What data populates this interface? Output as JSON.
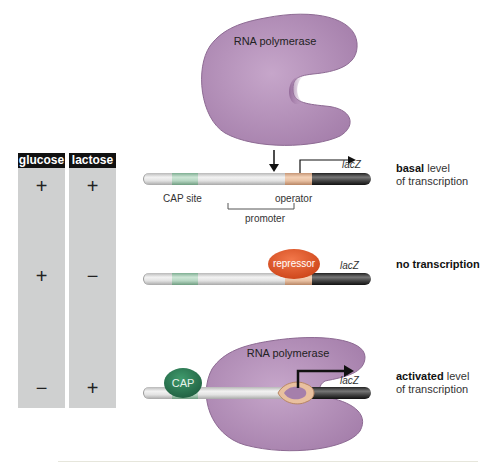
{
  "table": {
    "headers": [
      "glucose",
      "lactose"
    ],
    "rows": [
      {
        "glucose": "+",
        "lactose": "+"
      },
      {
        "glucose": "+",
        "lactose": "−"
      },
      {
        "glucose": "−",
        "lactose": "+"
      }
    ]
  },
  "panels": {
    "basal": {
      "polymerase_label": "RNA polymerase",
      "cap_site_label": "CAP site",
      "operator_label": "operator",
      "promoter_label": "promoter",
      "gene_label": "lacZ",
      "desc_bold": "basal",
      "desc_rest": " level",
      "desc_line2": "of transcription"
    },
    "none": {
      "repressor_label": "repressor",
      "gene_label": "lacZ",
      "desc_bold": "no transcription"
    },
    "activated": {
      "polymerase_label": "RNA polymerase",
      "cap_label": "CAP",
      "gene_label": "lacZ",
      "desc_bold": "activated",
      "desc_rest": " level",
      "desc_line2": "of transcription"
    }
  },
  "colors": {
    "polymerase": "#b38fb8",
    "cap_site": "#a8cdb4",
    "operator": "#e8bfa0",
    "gene": "#333333",
    "repressor": "#e2572b",
    "cap_protein": "#2e7a55",
    "table_bg": "#cfd0d0"
  }
}
